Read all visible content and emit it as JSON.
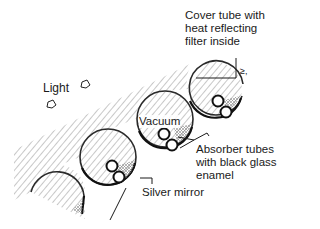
{
  "diagram": {
    "type": "evacuated-tube-solar-collector-cross-section",
    "labels": {
      "cover_tube": "Cover tube with\nheat reflecting\nfilter inside",
      "light": "Light",
      "vacuum": "Vacuum",
      "absorber": "Absorber tubes\nwith black glass\nenamel",
      "mirror": "Silver mirror",
      "small_mark": "≥,"
    },
    "colors": {
      "ink": "#1a1a1a",
      "hatch": "#9a9a9a",
      "background": "#ffffff"
    },
    "tubes": [
      {
        "id": "tube-1",
        "cx": 215,
        "cy": 89,
        "r": 27
      },
      {
        "id": "tube-2",
        "cx": 165,
        "cy": 119,
        "r": 28
      },
      {
        "id": "tube-3",
        "cx": 108,
        "cy": 157,
        "r": 28
      },
      {
        "id": "tube-4-partial",
        "cx": 58,
        "cy": 192,
        "r": 27
      }
    ]
  }
}
